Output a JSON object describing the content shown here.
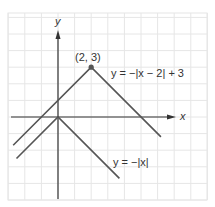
{
  "chart_data": {
    "type": "line",
    "title": "",
    "xlabel": "x",
    "ylabel": "y",
    "grid": true,
    "xlim": [
      -3,
      9
    ],
    "ylim": [
      -5,
      6
    ],
    "series": [
      {
        "name": "y = −|x − 2| + 3",
        "points": [
          [
            -2.7,
            -1.7
          ],
          [
            2,
            3
          ],
          [
            6.2,
            -1.2
          ]
        ]
      },
      {
        "name": "y = −|x|",
        "points": [
          [
            -2.5,
            -2.5
          ],
          [
            0,
            0
          ],
          [
            3.7,
            -3.7
          ]
        ]
      }
    ],
    "annotations": [
      {
        "text": "(2, 3)",
        "x": 2,
        "y": 3,
        "marker": true
      }
    ],
    "labels": {
      "vertex": "(2, 3)",
      "eq1": "y = −|x − 2| + 3",
      "eq2": "y = −|x|",
      "x_axis": "x",
      "y_axis": "y"
    }
  },
  "colors": {
    "grid": "#e6e6e6",
    "line": "#555555",
    "axis": "#333333"
  }
}
